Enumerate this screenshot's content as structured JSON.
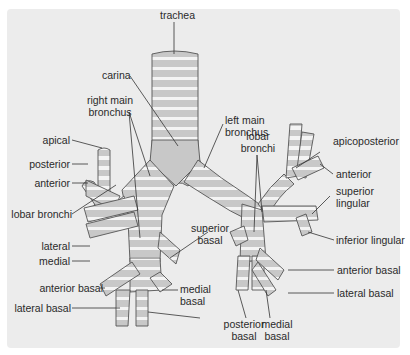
{
  "diagram": {
    "colors": {
      "panel": "#ececec",
      "cartilage": "#c8c8c8",
      "membrane": "#f4f4f4",
      "outline": "#555555",
      "label": "#2a2a2a"
    },
    "labels": {
      "trachea": "trachea",
      "carina": "carina",
      "right_main_bronchus_1": "right main",
      "right_main_bronchus_2": "bronchus",
      "left_main_bronchus_1": "left main",
      "left_main_bronchus_2": "bronchus",
      "lobar_bronchi_left_1": "lobar",
      "lobar_bronchi_left_2": "bronchi",
      "lobar_bronchi_right": "lobar bronchi",
      "apical": "apical",
      "posterior": "posterior",
      "anterior_right": "anterior",
      "lateral": "lateral",
      "medial": "medial",
      "anterior_basal_right": "anterior basal",
      "lateral_basal_right": "lateral basal",
      "superior_basal_right_1": "superior",
      "superior_basal_right_2": "basal",
      "medial_basal_right_1": "medial",
      "medial_basal_right_2": "basal",
      "posterior_basal_1": "posterior",
      "posterior_basal_2": "basal",
      "medial_basal_left_1": "medial",
      "medial_basal_left_2": "basal",
      "apicoposterior": "apicoposterior",
      "anterior_left": "anterior",
      "superior_lingular_1": "superior",
      "superior_lingular_2": "lingular",
      "inferior_lingular": "inferior lingular",
      "anterior_basal_left": "anterior basal",
      "lateral_basal_left": "lateral basal"
    }
  }
}
